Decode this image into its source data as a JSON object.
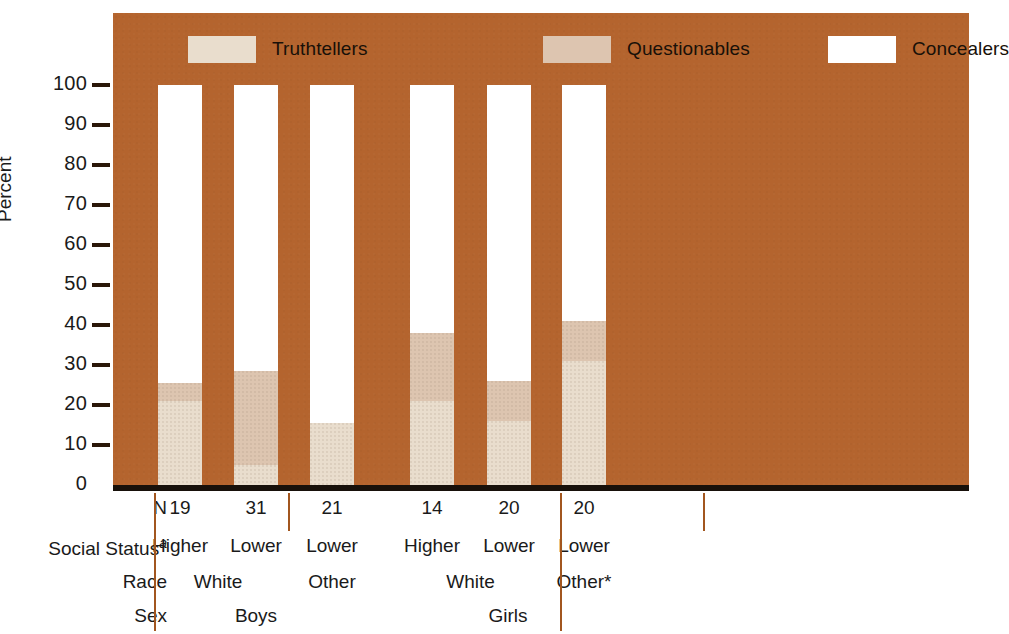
{
  "legend": {
    "items": [
      {
        "label": "Truthtellers",
        "color": "#e9ddcd"
      },
      {
        "label": "Questionables",
        "color": "#ddc5b0"
      },
      {
        "label": "Concealers",
        "color": "#ffffff"
      }
    ]
  },
  "axis": {
    "y_title": "Percent",
    "y_ticks": [
      "100",
      "90",
      "80",
      "70",
      "60",
      "50",
      "40",
      "30",
      "20",
      "10",
      "0"
    ]
  },
  "row_titles": {
    "n": "N",
    "social_status": "Social Status",
    "social_status_sup": "a",
    "race": "Race",
    "sex": "Sex"
  },
  "colors": {
    "panel_background": "#b4642e",
    "truthtellers": "#e9ddcd",
    "questionables": "#ddc5b0",
    "concealers": "#ffffff",
    "separator": "#a2561f",
    "axis_line": "#17100a"
  },
  "chart_data": {
    "type": "bar",
    "title": "",
    "xlabel": "",
    "ylabel": "Percent",
    "ylim": [
      0,
      100
    ],
    "grid": false,
    "legend_position": "top",
    "stacked": true,
    "categories": [
      "Higher / White / Boys",
      "Lower / White / Boys",
      "Lower / Other / Boys",
      "Higher / White / Girls",
      "Lower / White / Girls",
      "Lower / Other* / Girls"
    ],
    "series": [
      {
        "name": "Truthtellers",
        "values": [
          21,
          5,
          15.5,
          21,
          16,
          31
        ]
      },
      {
        "name": "Questionables",
        "values": [
          4.5,
          23.5,
          0,
          17,
          10,
          10
        ]
      },
      {
        "name": "Concealers",
        "values": [
          74.5,
          71.5,
          84.5,
          62,
          74,
          59
        ]
      }
    ],
    "group_labels": {
      "n": [
        "19",
        "31",
        "21",
        "14",
        "20",
        "20"
      ],
      "social_status": [
        "Higher",
        "Lower",
        "Lower",
        "Higher",
        "Lower",
        "Lower"
      ],
      "race": [
        "White",
        "Other",
        "White",
        "Other*"
      ],
      "sex": [
        "Boys",
        "Girls"
      ]
    }
  }
}
